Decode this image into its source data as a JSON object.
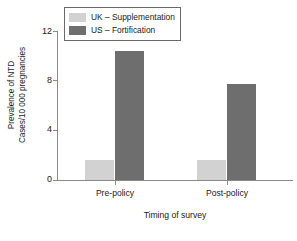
{
  "chart_data": {
    "type": "bar",
    "title": "",
    "categories": [
      "Pre-policy",
      "Post-policy"
    ],
    "series": [
      {
        "name": "UK – Supplementation",
        "color": "#d2d2d2",
        "values": [
          1.6,
          1.6
        ]
      },
      {
        "name": "US – Fortification",
        "color": "#6e6e6e",
        "values": [
          10.4,
          7.7
        ]
      }
    ],
    "xlabel": "Timing of survey",
    "ylabel": "Prevalence of NTD Cases/10 000 pregnancies",
    "ylabel_line1": "Prevalence of NTD",
    "ylabel_line2": "Cases/10 000 pregnancies",
    "yticks": [
      "0",
      "4",
      "8",
      "12"
    ],
    "ylim": [
      0,
      12
    ],
    "grid": false,
    "legend_position": "top-left-inside"
  },
  "legend": {
    "entries": [
      {
        "label": "UK – Supplementation",
        "swatch": "light"
      },
      {
        "label": "US – Fortification",
        "swatch": "dark"
      }
    ]
  },
  "axes": {
    "y": {
      "ticks": [
        {
          "label": "12",
          "value": 12
        },
        {
          "label": "8",
          "value": 8
        },
        {
          "label": "4",
          "value": 4
        },
        {
          "label": "0",
          "value": 0
        }
      ]
    },
    "x": {
      "label": "Timing of survey",
      "categories": [
        "Pre-policy",
        "Post-policy"
      ]
    }
  }
}
